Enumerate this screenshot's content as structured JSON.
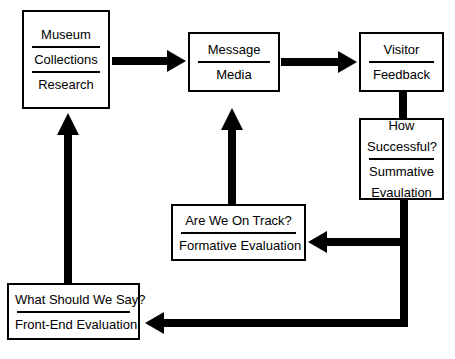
{
  "diagram": {
    "type": "flow-diagram",
    "colors": {
      "stroke": "#000000",
      "fill": "#ffffff",
      "text": "#000000"
    },
    "nodes": [
      {
        "id": "museum",
        "lines": [
          "Museum",
          "Collections",
          "Research"
        ],
        "dividers": 2
      },
      {
        "id": "message",
        "lines": [
          "Message",
          "Media"
        ],
        "dividers": 1
      },
      {
        "id": "visitor",
        "lines": [
          "Visitor",
          "Feedback"
        ],
        "dividers": 1
      },
      {
        "id": "how-successful",
        "lines": [
          "How",
          "Successful?",
          "Summative",
          "Evaulation"
        ],
        "dividers": 1
      },
      {
        "id": "on-track",
        "lines": [
          "Are We On Track?",
          "Formative Evaluation"
        ],
        "dividers": 1
      },
      {
        "id": "what-say",
        "lines": [
          "What Should We Say?",
          "Front-End Evaluation"
        ],
        "dividers": 1
      }
    ],
    "labels": {
      "museum_line1": "Museum",
      "museum_line2": "Collections",
      "museum_line3": "Research",
      "message_line1": "Message",
      "message_line2": "Media",
      "visitor_line1": "Visitor",
      "visitor_line2": "Feedback",
      "success_line1": "How",
      "success_line2": "Successful?",
      "success_line3": "Summative",
      "success_line4": "Evaulation",
      "ontrack_line1": "Are We On Track?",
      "ontrack_line2": "Formative Evaluation",
      "whatsay_line1": "What Should We Say?",
      "whatsay_line2": "Front-End Evaluation"
    },
    "edges": [
      {
        "id": "museum-to-message",
        "from": "museum",
        "to": "message",
        "direction": "right"
      },
      {
        "id": "message-to-visitor",
        "from": "message",
        "to": "visitor",
        "direction": "right"
      },
      {
        "id": "visitor-to-how-successful",
        "from": "visitor",
        "to": "how-successful",
        "direction": "down",
        "arrowhead": false
      },
      {
        "id": "on-track-to-message",
        "from": "on-track",
        "to": "message",
        "direction": "up"
      },
      {
        "id": "how-successful-to-on-track",
        "from": "how-successful",
        "to": "on-track",
        "direction": "left"
      },
      {
        "id": "how-successful-to-what-say",
        "from": "how-successful",
        "to": "what-say",
        "direction": "left"
      },
      {
        "id": "what-say-to-museum",
        "from": "what-say",
        "to": "museum",
        "direction": "up"
      }
    ]
  }
}
